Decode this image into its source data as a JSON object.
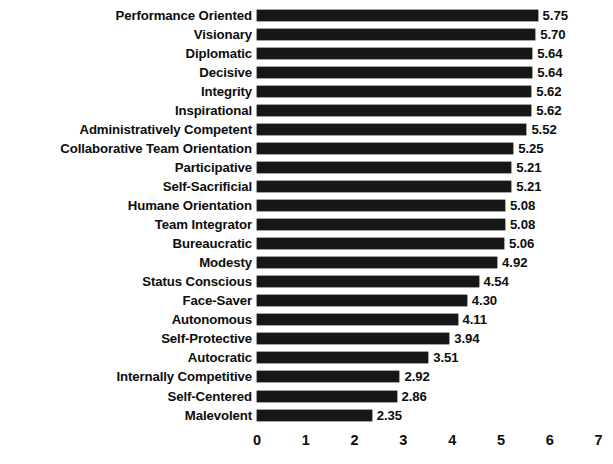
{
  "chart_data": {
    "type": "bar",
    "orientation": "horizontal",
    "title": "",
    "subtitle": "",
    "xlabel": "",
    "ylabel": "",
    "xlim": [
      0,
      7
    ],
    "x_ticks": [
      0,
      1,
      2,
      3,
      4,
      5,
      6,
      7
    ],
    "x_tick_labels": [
      "0",
      "1",
      "2",
      "3",
      "4",
      "5",
      "6",
      "7"
    ],
    "grid": false,
    "legend": null,
    "bar_color": "#171717",
    "value_label_format": "2-decimal",
    "categories": [
      "Performance Oriented",
      "Visionary",
      "Diplomatic",
      "Decisive",
      "Integrity",
      "Inspirational",
      "Administratively Competent",
      "Collaborative Team Orientation",
      "Participative",
      "Self-Sacrificial",
      "Humane Orientation",
      "Team Integrator",
      "Bureaucratic",
      "Modesty",
      "Status Conscious",
      "Face-Saver",
      "Autonomous",
      "Self-Protective",
      "Autocratic",
      "Internally Competitive",
      "Self-Centered",
      "Malevolent"
    ],
    "values": [
      5.75,
      5.7,
      5.64,
      5.64,
      5.62,
      5.62,
      5.52,
      5.25,
      5.21,
      5.21,
      5.08,
      5.08,
      5.06,
      4.92,
      4.54,
      4.3,
      4.11,
      3.94,
      3.51,
      2.92,
      2.86,
      2.35
    ],
    "value_labels": [
      "5.75",
      "5.70",
      "5.64",
      "5.64",
      "5.62",
      "5.62",
      "5.52",
      "5.25",
      "5.21",
      "5.21",
      "5.08",
      "5.08",
      "5.06",
      "4.92",
      "4.54",
      "4.30",
      "4.11",
      "3.94",
      "3.51",
      "2.92",
      "2.86",
      "2.35"
    ]
  }
}
